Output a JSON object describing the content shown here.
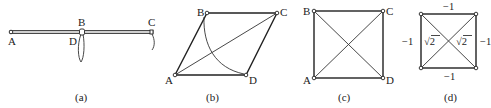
{
  "figure": {
    "panels": [
      {
        "id": "a",
        "caption": "(a)",
        "labels": {
          "A": "A",
          "B": "B",
          "C": "C",
          "D": "D"
        }
      },
      {
        "id": "b",
        "caption": "(b)",
        "labels": {
          "A": "A",
          "B": "B",
          "C": "C",
          "D": "D"
        }
      },
      {
        "id": "c",
        "caption": "(c)",
        "labels": {
          "A": "A",
          "B": "B",
          "C": "C",
          "D": "D"
        }
      },
      {
        "id": "d",
        "caption": "(d)",
        "edge_values": {
          "top": "−1",
          "bottom": "−1",
          "left": "−1",
          "right": "−1",
          "diag_left": "√2",
          "diag_right": "√2"
        }
      }
    ]
  }
}
